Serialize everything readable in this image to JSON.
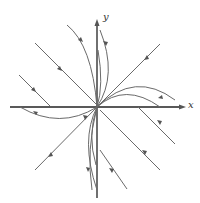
{
  "diagram": {
    "type": "phase-portrait",
    "axes": {
      "x_label": "x",
      "y_label": "y"
    },
    "colors": {
      "axis": "#222222",
      "trajectory": "#6a6a6a",
      "arrow": "#555555"
    }
  }
}
